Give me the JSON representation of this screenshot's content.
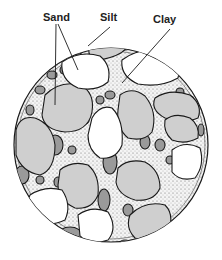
{
  "diagram": {
    "type": "soil-texture-cross-section",
    "labels": {
      "sand": "Sand",
      "silt": "Silt",
      "clay": "Clay"
    },
    "colors": {
      "sand_light": "#cfcfcf",
      "sand_white": "#ffffff",
      "silt": "#9a9a9a",
      "clay_matrix": "#ffffff",
      "outline": "#1a1a1a"
    }
  }
}
